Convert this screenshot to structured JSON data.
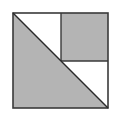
{
  "diagram": {
    "title": "",
    "colors": {
      "fill": "#b4b4b4",
      "stroke": "#3a3a3a",
      "background": "#ffffff"
    },
    "outer_square": {
      "x": 13,
      "y": 13,
      "size": 95
    },
    "inner_square": {
      "x": 61,
      "y": 13,
      "size": 48,
      "shaded": true
    },
    "lower_left_triangle": {
      "points": "13,13 13,108 108,108",
      "shaded": true
    },
    "upper_left_triangle": {
      "points": "13,13 61,13 61,61",
      "shaded": false
    },
    "right_triangle": {
      "points": "61,61 108,61 108,108",
      "shaded": false
    },
    "diagonal": {
      "x1": 13,
      "y1": 13,
      "x2": 108,
      "y2": 108
    }
  }
}
